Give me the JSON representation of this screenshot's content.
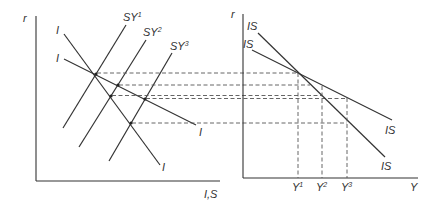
{
  "diagram": {
    "left_panel": {
      "y_axis_label": "r",
      "x_axis_label": "I,S",
      "curves": [
        {
          "name": "I",
          "label": "I",
          "kind": "investment-steep"
        },
        {
          "name": "I",
          "label": "I",
          "kind": "investment-flat"
        },
        {
          "name": "SY1",
          "label": "SY",
          "sup": "1"
        },
        {
          "name": "SY2",
          "label": "SY",
          "sup": "2"
        },
        {
          "name": "SY3",
          "label": "SY",
          "sup": "3"
        }
      ],
      "labels": {
        "i_steep_top": "I",
        "i_flat_top": "I",
        "i_flat_bottom": "I",
        "i_steep_bottom": "I",
        "sy1": "SY",
        "sy1_sup": "1",
        "sy2": "SY",
        "sy2_sup": "2",
        "sy3": "SY",
        "sy3_sup": "3"
      }
    },
    "right_panel": {
      "y_axis_label": "r",
      "x_axis_label": "Y",
      "labels": {
        "is_steep_top": "IS",
        "is_flat_top": "IS",
        "is_flat_bottom": "IS",
        "is_steep_bottom": "IS",
        "y1": "Y",
        "y1_sup": "1",
        "y2": "Y",
        "y2_sup": "2",
        "y3": "Y",
        "y3_sup": "3"
      },
      "income_levels": [
        "Y1",
        "Y2",
        "Y3"
      ]
    },
    "line_color": "#333333"
  }
}
